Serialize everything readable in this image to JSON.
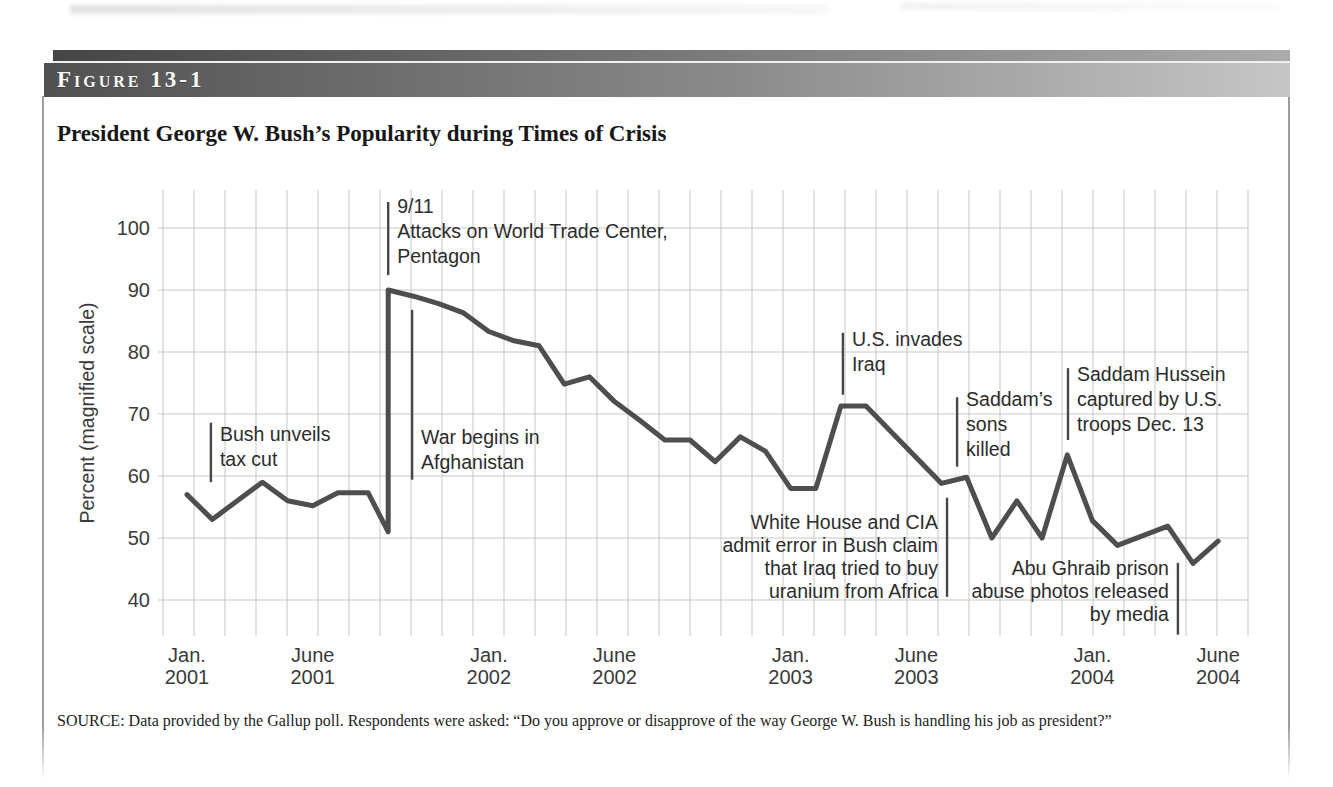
{
  "figure": {
    "label": "Figure 13-1",
    "title": "President George W. Bush’s Popularity during Times of Crisis",
    "source": "SOURCE: Data provided by the Gallup poll. Respondents were asked: “Do you approve or disapprove of the way George W. Bush is handling his job as president?”"
  },
  "colors": {
    "header_dark": "#4a4a4a",
    "header_light": "#c6c6c6",
    "data_line": "#4e4e4e",
    "grid": "#c7c7c7",
    "annotation_line": "#474747",
    "text": "#2c2c2c",
    "border": "#9d9d9d"
  },
  "chart_data": {
    "type": "line",
    "title": "President George W. Bush’s Popularity during Times of Crisis",
    "xlabel": "",
    "ylabel": "Percent (magnified scale)",
    "x_unit": "months since Jan 2001",
    "ylim": [
      40,
      106
    ],
    "grid": true,
    "legend": "none",
    "yticks": [
      100,
      90,
      80,
      70,
      60,
      50,
      40
    ],
    "xticks": [
      {
        "t": 0,
        "lines": [
          "Jan.",
          "2001"
        ]
      },
      {
        "t": 5,
        "lines": [
          "June",
          "2001"
        ]
      },
      {
        "t": 12,
        "lines": [
          "Jan.",
          "2002"
        ]
      },
      {
        "t": 17,
        "lines": [
          "June",
          "2002"
        ]
      },
      {
        "t": 24,
        "lines": [
          "Jan.",
          "2003"
        ]
      },
      {
        "t": 29,
        "lines": [
          "June",
          "2003"
        ]
      },
      {
        "t": 36,
        "lines": [
          "Jan.",
          "2004"
        ]
      },
      {
        "t": 41,
        "lines": [
          "June",
          "2004"
        ]
      }
    ],
    "series": [
      {
        "name": "approval",
        "points": [
          [
            0,
            57
          ],
          [
            1,
            53
          ],
          [
            3,
            59
          ],
          [
            4,
            56
          ],
          [
            5,
            55.2
          ],
          [
            6,
            57.3
          ],
          [
            7.2,
            57.3
          ],
          [
            8,
            51
          ],
          [
            8,
            90
          ],
          [
            9,
            89
          ],
          [
            10,
            87.8
          ],
          [
            11,
            86.3
          ],
          [
            12,
            83.3
          ],
          [
            13,
            81.8
          ],
          [
            14,
            81
          ],
          [
            15,
            74.8
          ],
          [
            16,
            76
          ],
          [
            17,
            72
          ],
          [
            18,
            69
          ],
          [
            19,
            65.8
          ],
          [
            20,
            65.8
          ],
          [
            21,
            62.3
          ],
          [
            22,
            66.3
          ],
          [
            23,
            64
          ],
          [
            24,
            58
          ],
          [
            25,
            58
          ],
          [
            26,
            71.3
          ],
          [
            27,
            71.3
          ],
          [
            30,
            58.8
          ],
          [
            31,
            59.8
          ],
          [
            32,
            50
          ],
          [
            33,
            56
          ],
          [
            34,
            50
          ],
          [
            35,
            63.4
          ],
          [
            36,
            52.8
          ],
          [
            37,
            48.8
          ],
          [
            39,
            51.9
          ],
          [
            40,
            45.9
          ],
          [
            41,
            49.5
          ]
        ]
      }
    ],
    "annotations": [
      {
        "id": "tax-cut",
        "t": 0.95,
        "line": [
          68.6,
          59
        ],
        "text_v": 68.3,
        "align": "left",
        "lines": [
          "Bush unveils",
          "tax cut"
        ]
      },
      {
        "id": "nine-eleven",
        "t": 8.0,
        "line": [
          104.2,
          92.4
        ],
        "text_v": 105,
        "align": "left",
        "lines": [
          "9/11",
          "Attacks on World Trade Center,",
          "Pentagon"
        ]
      },
      {
        "id": "afghanistan-war",
        "t": 8.95,
        "line": [
          86.8,
          59.4
        ],
        "text_v": 67.8,
        "align": "left",
        "lines": [
          "War begins in",
          "Afghanistan"
        ]
      },
      {
        "id": "iraq-invasion",
        "t": 26.08,
        "line": [
          83.1,
          73.1
        ],
        "text_v": 83.6,
        "align": "left",
        "lines": [
          "U.S. invades",
          "Iraq"
        ]
      },
      {
        "id": "saddam-sons-killed",
        "t": 30.62,
        "line": [
          72.7,
          61.5
        ],
        "text_v": 73.8,
        "align": "left",
        "lines": [
          "Saddam’s",
          "sons",
          "killed"
        ]
      },
      {
        "id": "saddam-captured",
        "t": 35.03,
        "line": [
          77.4,
          65.8
        ],
        "text_v": 77.9,
        "align": "left",
        "lines": [
          "Saddam Hussein",
          "captured by U.S.",
          "troops Dec. 13"
        ]
      },
      {
        "id": "uranium-claim-error",
        "t": 30.22,
        "line": [
          56.5,
          40.5
        ],
        "text_v": 54.0,
        "align": "right",
        "line_height": 23,
        "lines": [
          "White House and CIA",
          "admit error in Bush claim",
          "that Iraq tried to buy",
          "uranium from Africa"
        ]
      },
      {
        "id": "abu-ghraib",
        "t": 39.4,
        "line": [
          46,
          34.4
        ],
        "text_v": 46.6,
        "align": "right",
        "line_height": 23,
        "lines": [
          "Abu Ghraib prison",
          "abuse photos released",
          "by media"
        ]
      }
    ]
  }
}
